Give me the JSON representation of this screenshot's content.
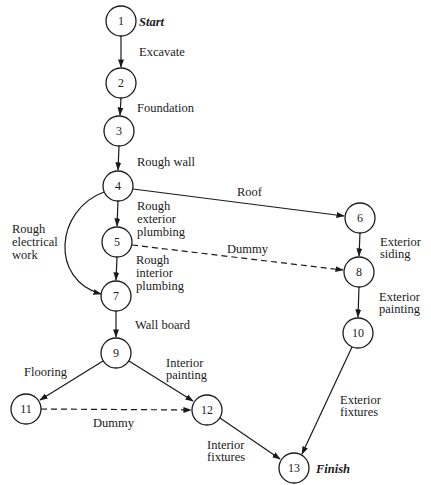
{
  "diagram": {
    "type": "activity-on-arrow network",
    "start_label": "Start",
    "finish_label": "Finish",
    "nodes": [
      {
        "id": "1",
        "label": "1",
        "x": 121,
        "y": 21
      },
      {
        "id": "2",
        "label": "2",
        "x": 121,
        "y": 83
      },
      {
        "id": "3",
        "label": "3",
        "x": 119,
        "y": 131
      },
      {
        "id": "4",
        "label": "4",
        "x": 118,
        "y": 186
      },
      {
        "id": "5",
        "label": "5",
        "x": 117,
        "y": 242
      },
      {
        "id": "6",
        "label": "6",
        "x": 360,
        "y": 218
      },
      {
        "id": "7",
        "label": "7",
        "x": 116,
        "y": 296
      },
      {
        "id": "8",
        "label": "8",
        "x": 359,
        "y": 272
      },
      {
        "id": "9",
        "label": "9",
        "x": 116,
        "y": 353
      },
      {
        "id": "10",
        "label": "10",
        "x": 358,
        "y": 333
      },
      {
        "id": "11",
        "label": "11",
        "x": 26,
        "y": 409
      },
      {
        "id": "12",
        "label": "12",
        "x": 207,
        "y": 410
      },
      {
        "id": "13",
        "label": "13",
        "x": 294,
        "y": 468
      }
    ],
    "edges": [
      {
        "from": "1",
        "to": "2",
        "label": "Excavate",
        "dummy": false
      },
      {
        "from": "2",
        "to": "3",
        "label": "Foundation",
        "dummy": false
      },
      {
        "from": "3",
        "to": "4",
        "label": "Rough wall",
        "dummy": false
      },
      {
        "from": "4",
        "to": "6",
        "label": "Roof",
        "dummy": false
      },
      {
        "from": "4",
        "to": "5",
        "label": "Rough exterior plumbing",
        "dummy": false
      },
      {
        "from": "4",
        "to": "7",
        "label": "Rough electrical work",
        "dummy": false
      },
      {
        "from": "5",
        "to": "7",
        "label": "Rough interior plumbing",
        "dummy": false
      },
      {
        "from": "5",
        "to": "8",
        "label": "Dummy",
        "dummy": true
      },
      {
        "from": "6",
        "to": "8",
        "label": "Exterior siding",
        "dummy": false
      },
      {
        "from": "8",
        "to": "10",
        "label": "Exterior painting",
        "dummy": false
      },
      {
        "from": "7",
        "to": "9",
        "label": "Wall board",
        "dummy": false
      },
      {
        "from": "9",
        "to": "11",
        "label": "Flooring",
        "dummy": false
      },
      {
        "from": "9",
        "to": "12",
        "label": "Interior painting",
        "dummy": false
      },
      {
        "from": "11",
        "to": "12",
        "label": "Dummy",
        "dummy": true
      },
      {
        "from": "12",
        "to": "13",
        "label": "Interior fixtures",
        "dummy": false
      },
      {
        "from": "10",
        "to": "13",
        "label": "Exterior fixtures",
        "dummy": false
      }
    ],
    "labels": {
      "excavate": "Excavate",
      "foundation": "Foundation",
      "rough_wall": "Rough wall",
      "roof": "Roof",
      "rough_exterior_plumbing": [
        "Rough",
        "exterior",
        "plumbing"
      ],
      "rough_electrical_work": [
        "Rough",
        "electrical",
        "work"
      ],
      "rough_interior_plumbing": [
        "Rough",
        "interior",
        "plumbing"
      ],
      "dummy_5_8": "Dummy",
      "exterior_siding": [
        "Exterior",
        "siding"
      ],
      "exterior_painting": [
        "Exterior",
        "painting"
      ],
      "wall_board": "Wall board",
      "flooring": "Flooring",
      "interior_painting": [
        "Interior",
        "painting"
      ],
      "dummy_11_12": "Dummy",
      "interior_fixtures": [
        "Interior",
        "fixtures"
      ],
      "exterior_fixtures": [
        "Exterior",
        "fixtures"
      ]
    }
  }
}
